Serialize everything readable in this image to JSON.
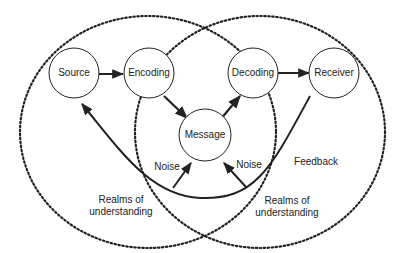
{
  "diagram": {
    "nodes": {
      "source": "Source",
      "encoding": "Encoding",
      "message": "Message",
      "decoding": "Decoding",
      "receiver": "Receiver"
    },
    "labels": {
      "noise_left": "Noise",
      "noise_right": "Noise",
      "feedback": "Feedback",
      "realms_left_1": "Realms of",
      "realms_left_2": "understanding",
      "realms_right_1": "Realms of",
      "realms_right_2": "understanding"
    },
    "colors": {
      "stroke": "#222222",
      "background": "#ffffff"
    }
  }
}
